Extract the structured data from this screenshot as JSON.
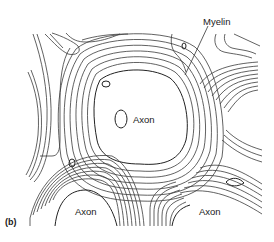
{
  "figure": {
    "panel_label": "(b)",
    "labels": {
      "myelin": "Myelin",
      "axon_center": "Axon",
      "axon_bottom_left": "Axon",
      "axon_bottom_right": "Axon"
    },
    "colors": {
      "line": "#3a3a3a",
      "background": "#ffffff",
      "text": "#1a1a1a"
    }
  }
}
